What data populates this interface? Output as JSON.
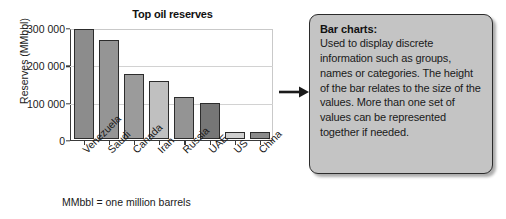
{
  "chart_data": {
    "type": "bar",
    "title": "Top oil reserves",
    "xlabel": "",
    "ylabel": "Reserves (MMbbl)",
    "categories": [
      "Venezuela",
      "Saudi",
      "Canada",
      "Iran",
      "Russia",
      "UAE",
      "US",
      "China"
    ],
    "values": [
      297000,
      265000,
      175000,
      157000,
      113000,
      98000,
      20000,
      20000
    ],
    "ylim": [
      0,
      300000
    ],
    "yticks": [
      0,
      100000,
      200000,
      300000
    ],
    "ytick_labels": [
      "0",
      "100 000",
      "200 000",
      "300 000"
    ],
    "grid": true,
    "legend": false,
    "bar_colors": [
      "#8c8c8c",
      "#959595",
      "#9b9b9b",
      "#c0c0c0",
      "#949494",
      "#767676",
      "#cfcfcf",
      "#8a8a8a"
    ],
    "annotation": "MMbbl = one million barrels"
  },
  "chart": {
    "title": "Top oil reserves",
    "y_axis_title": "Reserves (MMbbl)",
    "footnote": "MMbbl = one million barrels"
  },
  "arrow": {
    "name": "arrow-right-icon"
  },
  "callout": {
    "heading": "Bar charts:",
    "body": "Used to display discrete information such as groups, names or categories. The height of the bar relates to the size of the values. More than one set of values can be represented together if needed."
  }
}
